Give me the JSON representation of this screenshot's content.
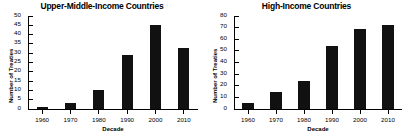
{
  "chart_data": [
    {
      "type": "bar",
      "title": "Upper-Middle-Income Countries",
      "xlabel": "Decade",
      "ylabel": "Number of Treaties",
      "categories": [
        "1960",
        "1970",
        "1980",
        "1990",
        "2000",
        "2010"
      ],
      "values": [
        1,
        3,
        10,
        29,
        45,
        33
      ],
      "ylim": [
        0,
        50
      ],
      "yticks": [
        0,
        5,
        10,
        15,
        20,
        25,
        30,
        35,
        40,
        45,
        50
      ],
      "grid": false,
      "legend": "none",
      "bar_color": "#111111"
    },
    {
      "type": "bar",
      "title": "High-Income Countries",
      "xlabel": "Decade",
      "ylabel": "Number of Treaties",
      "categories": [
        "1960",
        "1970",
        "1980",
        "1990",
        "2000",
        "2010"
      ],
      "values": [
        5,
        15,
        24,
        54,
        69,
        72
      ],
      "ylim": [
        0,
        80
      ],
      "yticks": [
        0,
        10,
        20,
        30,
        40,
        50,
        60,
        70,
        80
      ],
      "grid": false,
      "legend": "none",
      "bar_color": "#111111"
    }
  ]
}
